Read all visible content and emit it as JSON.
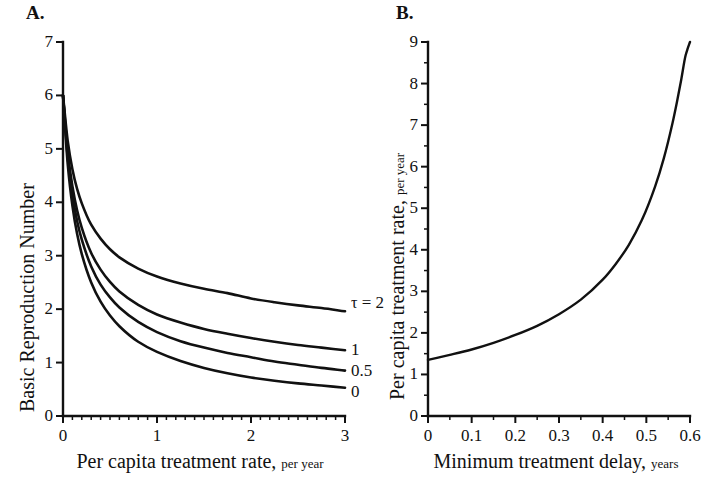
{
  "figure": {
    "background": "#ffffff",
    "ink_color": "#111111"
  },
  "panels": {
    "a": {
      "letter": "A.",
      "x_title_main": "Per capita treatment rate,",
      "x_title_units": "per year",
      "y_title_main": "Basic Reproduction Number",
      "y_ticks": [
        "0",
        "1",
        "2",
        "3",
        "4",
        "5",
        "6",
        "7"
      ],
      "x_ticks": [
        "0",
        "1",
        "2",
        "3"
      ],
      "curve_labels": [
        "τ = 2",
        "1",
        "0.5",
        "0"
      ]
    },
    "b": {
      "letter": "B.",
      "x_title_main": "Minimum treatment delay,",
      "x_title_units": "years",
      "y_title_main": "Per capita treatment rate,",
      "y_title_units": "per year",
      "y_ticks": [
        "0",
        "1",
        "2",
        "3",
        "4",
        "5",
        "6",
        "7",
        "8",
        "9"
      ],
      "x_ticks": [
        "0",
        "0.1",
        "0.2",
        "0.3",
        "0.4",
        "0.5",
        "0.6"
      ]
    }
  },
  "chart_data": [
    {
      "type": "line",
      "panel": "A",
      "title": "A.",
      "xlabel": "Per capita treatment rate, per year",
      "ylabel": "Basic Reproduction Number",
      "xlim": [
        0,
        3
      ],
      "ylim": [
        0,
        7
      ],
      "xticks": [
        0,
        1,
        2,
        3
      ],
      "yticks": [
        0,
        1,
        2,
        3,
        4,
        5,
        6,
        7
      ],
      "x_minor_tick_step": 0.1,
      "grid": false,
      "legend": "inline-right-of-curve",
      "series": [
        {
          "name": "τ = 2",
          "label": "τ = 2",
          "x": [
            0,
            0.05,
            0.1,
            0.15,
            0.2,
            0.3,
            0.4,
            0.5,
            0.6,
            0.8,
            1.0,
            1.25,
            1.5,
            1.75,
            2.0,
            2.25,
            2.5,
            2.75,
            3.0
          ],
          "y": [
            6.0,
            5.15,
            4.62,
            4.25,
            3.98,
            3.58,
            3.32,
            3.12,
            2.97,
            2.76,
            2.61,
            2.48,
            2.38,
            2.3,
            2.2,
            2.13,
            2.07,
            2.02,
            1.96
          ]
        },
        {
          "name": "τ = 1",
          "label": "1",
          "x": [
            0,
            0.05,
            0.1,
            0.15,
            0.2,
            0.3,
            0.4,
            0.5,
            0.6,
            0.8,
            1.0,
            1.25,
            1.5,
            1.75,
            2.0,
            2.25,
            2.5,
            2.75,
            3.0
          ],
          "y": [
            6.0,
            4.95,
            4.3,
            3.85,
            3.52,
            3.05,
            2.74,
            2.51,
            2.33,
            2.08,
            1.9,
            1.75,
            1.63,
            1.54,
            1.46,
            1.39,
            1.33,
            1.28,
            1.23
          ]
        },
        {
          "name": "τ = 0.5",
          "label": "0.5",
          "x": [
            0,
            0.05,
            0.1,
            0.15,
            0.2,
            0.3,
            0.4,
            0.5,
            0.6,
            0.8,
            1.0,
            1.25,
            1.5,
            1.75,
            2.0,
            2.25,
            2.5,
            2.75,
            3.0
          ],
          "y": [
            6.0,
            4.85,
            4.14,
            3.65,
            3.3,
            2.8,
            2.46,
            2.22,
            2.03,
            1.76,
            1.57,
            1.4,
            1.28,
            1.18,
            1.1,
            1.02,
            0.96,
            0.9,
            0.85
          ]
        },
        {
          "name": "τ = 0",
          "label": "0",
          "x": [
            0,
            0.05,
            0.1,
            0.15,
            0.2,
            0.3,
            0.4,
            0.5,
            0.6,
            0.8,
            1.0,
            1.25,
            1.5,
            1.75,
            2.0,
            2.25,
            2.5,
            2.75,
            3.0
          ],
          "y": [
            6.0,
            4.72,
            3.94,
            3.41,
            3.03,
            2.5,
            2.14,
            1.88,
            1.68,
            1.39,
            1.2,
            1.03,
            0.9,
            0.8,
            0.72,
            0.66,
            0.61,
            0.57,
            0.53
          ]
        }
      ]
    },
    {
      "type": "line",
      "panel": "B",
      "title": "B.",
      "xlabel": "Minimum treatment delay, years",
      "ylabel": "Per capita treatment rate, per year",
      "xlim": [
        0,
        0.6
      ],
      "ylim": [
        0,
        9
      ],
      "xticks": [
        0,
        0.1,
        0.2,
        0.3,
        0.4,
        0.5,
        0.6
      ],
      "yticks": [
        0,
        1,
        2,
        3,
        4,
        5,
        6,
        7,
        8,
        9
      ],
      "grid": false,
      "legend": "none",
      "series": [
        {
          "name": "critical treatment rate",
          "x": [
            0,
            0.05,
            0.1,
            0.15,
            0.2,
            0.25,
            0.3,
            0.35,
            0.4,
            0.43,
            0.46,
            0.49,
            0.52,
            0.54,
            0.56,
            0.57,
            0.58,
            0.59,
            0.595,
            0.6
          ],
          "y": [
            1.35,
            1.47,
            1.6,
            1.76,
            1.95,
            2.17,
            2.45,
            2.8,
            3.28,
            3.66,
            4.12,
            4.72,
            5.52,
            6.2,
            7.05,
            7.55,
            8.1,
            8.68,
            8.85,
            9.0
          ]
        }
      ]
    }
  ]
}
